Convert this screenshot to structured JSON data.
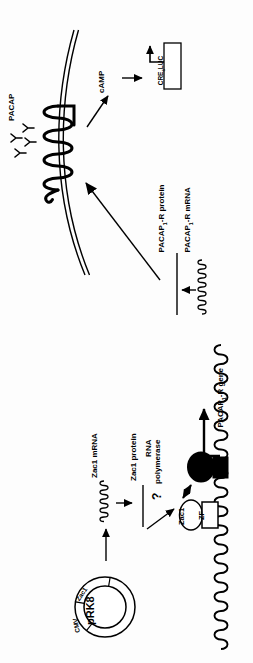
{
  "colors": {
    "ink": "#000000",
    "paper": "#fdfdfd"
  },
  "plasmid": {
    "name": "pRK8",
    "segments": [
      "Zac1",
      "CMV"
    ]
  },
  "expression_cassette": {
    "mrna_label": "Zac1 mRNA",
    "protein_label": "Zac1 protein"
  },
  "promoter_complex": {
    "rna_polymerase_line1": "RNA",
    "rna_polymerase_line2": "polymerase",
    "question_mark": "?",
    "tata_label": "TATA",
    "zac1_oval_label": "Zac1",
    "zf_box_label": "ZF",
    "gene_label": {
      "pre": "PACAP",
      "sub": "1",
      "post": "-R gene"
    }
  },
  "receptor_pathway": {
    "ligand_label": "PACAP",
    "second_messenger": "cAMP",
    "reporter_box": {
      "pre": "CRE",
      "sub": "6",
      "post": "LUC"
    },
    "protein_label": {
      "pre": "PACAP",
      "sub": "1",
      "post": "-R protein"
    },
    "mrna_label": {
      "pre": "PACAP",
      "sub": "1",
      "post": "-R mRNA"
    }
  }
}
